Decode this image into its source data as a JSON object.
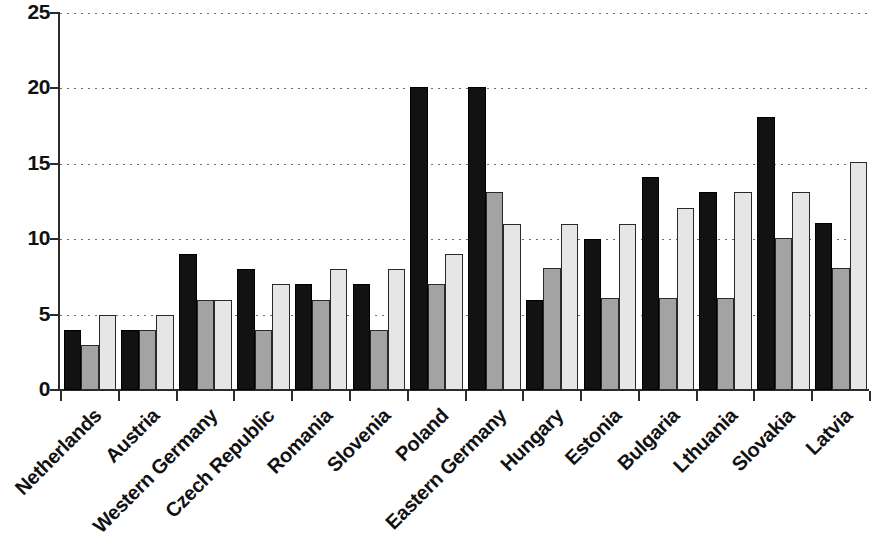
{
  "chart_data": {
    "type": "bar",
    "title": "",
    "subtitle": "",
    "xlabel": "",
    "ylabel": "",
    "ylim": [
      0,
      25
    ],
    "ytick_values": [
      0,
      5,
      10,
      15,
      20,
      25
    ],
    "ytick_labels": [
      "0",
      "5",
      "10",
      "15",
      "20",
      "25"
    ],
    "grid": true,
    "grid_axis": "y",
    "grid_style": "dotted",
    "legend": false,
    "legend_position": "none",
    "xtick_rotation": -45,
    "categories": [
      "Netherlands",
      "Austria",
      "Western Germany",
      "Czech Republic",
      "Romania",
      "Slovenia",
      "Poland",
      "Eastern Germany",
      "Hungary",
      "Estonia",
      "Bulgaria",
      "Lthuania",
      "Slovakia",
      "Latvia"
    ],
    "series": [
      {
        "name": "series-1",
        "color": "#121212",
        "values": [
          4,
          4,
          9,
          8,
          7,
          7,
          20.1,
          20.1,
          6,
          10,
          14.1,
          13.1,
          18.1,
          11.1
        ]
      },
      {
        "name": "series-2",
        "color": "#a3a3a3",
        "values": [
          3,
          4,
          6,
          4,
          6,
          4,
          7,
          13.1,
          8.1,
          6.1,
          6.1,
          6.1,
          10.1,
          8.1
        ]
      },
      {
        "name": "series-3",
        "color": "#e6e6e6",
        "values": [
          5,
          5,
          6,
          7,
          8,
          8,
          9,
          11,
          11,
          11,
          12.1,
          13.1,
          13.1,
          15.1
        ]
      }
    ]
  }
}
